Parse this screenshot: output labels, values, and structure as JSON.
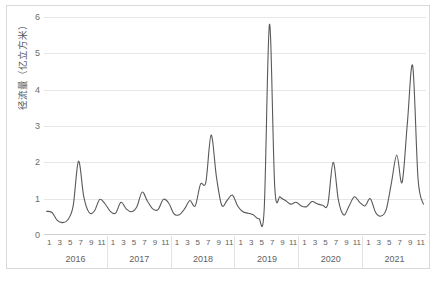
{
  "chart_data": {
    "type": "line",
    "title": "",
    "xlabel": "",
    "ylabel": "径流量（亿立方米）",
    "ylim": [
      0,
      6
    ],
    "yticks": [
      0,
      1,
      2,
      3,
      4,
      5,
      6
    ],
    "ytick_labels": [
      "0",
      "1",
      "2",
      "3",
      "4",
      "5",
      "6"
    ],
    "grid": true,
    "legend": "none",
    "x_month_ticks": [
      "1",
      "3",
      "5",
      "7",
      "9",
      "11"
    ],
    "years": [
      "2016",
      "2017",
      "2018",
      "2019",
      "2020",
      "2021"
    ],
    "x": [
      "2016-01",
      "2016-02",
      "2016-03",
      "2016-04",
      "2016-05",
      "2016-06",
      "2016-07",
      "2016-08",
      "2016-09",
      "2016-10",
      "2016-11",
      "2016-12",
      "2017-01",
      "2017-02",
      "2017-03",
      "2017-04",
      "2017-05",
      "2017-06",
      "2017-07",
      "2017-08",
      "2017-09",
      "2017-10",
      "2017-11",
      "2017-12",
      "2018-01",
      "2018-02",
      "2018-03",
      "2018-04",
      "2018-05",
      "2018-06",
      "2018-07",
      "2018-08",
      "2018-09",
      "2018-10",
      "2018-11",
      "2018-12",
      "2019-01",
      "2019-02",
      "2019-03",
      "2019-04",
      "2019-05",
      "2019-06",
      "2019-07",
      "2019-08",
      "2019-09",
      "2019-10",
      "2019-11",
      "2019-12",
      "2020-01",
      "2020-02",
      "2020-03",
      "2020-04",
      "2020-05",
      "2020-06",
      "2020-07",
      "2020-08",
      "2020-09",
      "2020-10",
      "2020-11",
      "2020-12",
      "2021-01",
      "2021-02",
      "2021-03",
      "2021-04",
      "2021-05",
      "2021-06",
      "2021-07",
      "2021-08",
      "2021-09",
      "2021-10",
      "2021-11",
      "2021-12"
    ],
    "series": [
      {
        "name": "径流量",
        "color": "#595959",
        "values": [
          0.65,
          0.62,
          0.4,
          0.34,
          0.42,
          0.8,
          2.03,
          1.05,
          0.62,
          0.66,
          0.98,
          0.86,
          0.65,
          0.6,
          0.9,
          0.72,
          0.64,
          0.78,
          1.18,
          0.93,
          0.72,
          0.7,
          0.98,
          0.88,
          0.58,
          0.56,
          0.72,
          0.95,
          0.8,
          1.4,
          1.45,
          2.75,
          1.6,
          0.82,
          0.95,
          1.1,
          0.8,
          0.64,
          0.6,
          0.55,
          0.45,
          0.7,
          5.8,
          1.3,
          1.05,
          0.95,
          0.85,
          0.9,
          0.8,
          0.78,
          0.92,
          0.86,
          0.82,
          0.85,
          2.0,
          0.95,
          0.55,
          0.8,
          1.05,
          0.9,
          0.8,
          1.0,
          0.62,
          0.52,
          0.7,
          1.45,
          2.2,
          1.45,
          3.1,
          4.65,
          1.55,
          0.85
        ]
      }
    ]
  }
}
